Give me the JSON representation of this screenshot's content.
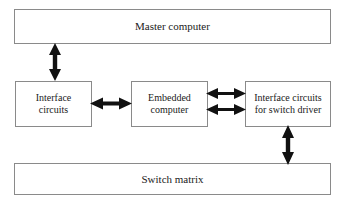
{
  "diagram": {
    "background_color": "#ffffff",
    "border_color": "#8a8a8a",
    "text_color": "#1a1a1a",
    "arrow_color": "#111111",
    "nodes": {
      "master": {
        "label": "Master computer"
      },
      "interface": {
        "label": "Interface\ncircuits"
      },
      "embedded": {
        "label": "Embedded\ncomputer"
      },
      "switch_driver": {
        "label": "Interface circuits\nfor switch driver"
      },
      "switch_matrix": {
        "label": "Switch matrix"
      }
    },
    "connectors": [
      {
        "id": "master-interface",
        "from": "master",
        "to": "interface",
        "orientation": "vertical",
        "heads": "double"
      },
      {
        "id": "interface-embedded",
        "from": "interface",
        "to": "embedded",
        "orientation": "horizontal",
        "heads": "double"
      },
      {
        "id": "embedded-switch-driver-upper",
        "from": "embedded",
        "to": "switch_driver",
        "orientation": "horizontal",
        "heads": "double"
      },
      {
        "id": "embedded-switch-driver-lower",
        "from": "embedded",
        "to": "switch_driver",
        "orientation": "horizontal",
        "heads": "double"
      },
      {
        "id": "switch-driver-matrix",
        "from": "switch_driver",
        "to": "switch_matrix",
        "orientation": "vertical",
        "heads": "double"
      }
    ]
  }
}
